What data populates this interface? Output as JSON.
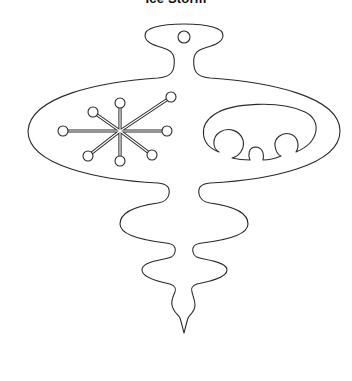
{
  "title": "Ice Storm",
  "artwork": {
    "subject": "ornament-outline",
    "stroke_color": "#2a2a2a",
    "background_color": "#ffffff",
    "hanger_loop": {
      "cx": 184,
      "cy": 37,
      "r": 6
    },
    "snowflake": {
      "center": [
        120,
        131
      ],
      "nodes": [
        [
          120,
          103
        ],
        [
          120,
          161
        ],
        [
          63,
          131
        ],
        [
          167,
          131
        ],
        [
          93,
          112
        ],
        [
          88,
          156
        ],
        [
          171,
          97
        ],
        [
          152,
          155
        ]
      ],
      "node_radius": 5
    },
    "bubbles": [
      {
        "cx": 230,
        "cy": 142,
        "r": 14
      },
      {
        "cx": 256,
        "cy": 153,
        "r": 7
      },
      {
        "cx": 286,
        "cy": 144,
        "r": 11
      }
    ]
  }
}
